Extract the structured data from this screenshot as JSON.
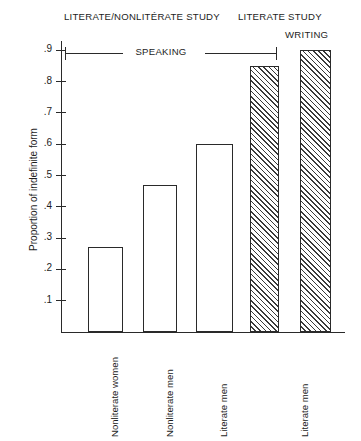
{
  "figure": {
    "group_titles": {
      "left": "LITERATE/NONLITÉRATE STUDY",
      "right": "LITERATE STUDY"
    },
    "annotations": {
      "speaking": "SPEAKING",
      "writing": "WRITING"
    }
  },
  "chart_data": {
    "type": "bar",
    "title": "",
    "xlabel": "",
    "ylabel": "Proportion of indefinite form",
    "ylim": [
      0,
      0.95
    ],
    "grid": false,
    "legend": false,
    "ytick_labels": [
      ".9",
      ".8",
      ".7",
      ".6",
      ".5",
      ".4",
      ".3",
      ".2",
      ".1"
    ],
    "ytick_values": [
      0.9,
      0.8,
      0.7,
      0.6,
      0.5,
      0.4,
      0.3,
      0.2,
      0.1
    ],
    "categories": [
      "Nonliterate women",
      "Nonliterate men",
      "Literate men",
      "Literate men"
    ],
    "bars": [
      {
        "label": "Nonliterate women",
        "value": 0.27,
        "fill": "open",
        "group": "LITERATE/NONLITÉRATE STUDY",
        "modality": "SPEAKING"
      },
      {
        "label": "Nonliterate men",
        "value": 0.47,
        "fill": "open",
        "group": "LITERATE/NONLITÉRATE STUDY",
        "modality": "SPEAKING"
      },
      {
        "label": "Literate men",
        "value": 0.6,
        "fill": "open",
        "group": "LITERATE/NONLITÉRATE STUDY",
        "modality": "SPEAKING"
      },
      {
        "label": "Literate men",
        "value": 0.85,
        "fill": "hatched",
        "group": "LITERATE STUDY",
        "modality": "SPEAKING"
      },
      {
        "label": "",
        "value": 0.9,
        "fill": "hatched",
        "group": "LITERATE STUDY",
        "modality": "WRITING"
      }
    ],
    "colors": {
      "line": "#2a2a2a",
      "bar_face": "#ffffff",
      "hatch": "#3a3a3a"
    }
  }
}
